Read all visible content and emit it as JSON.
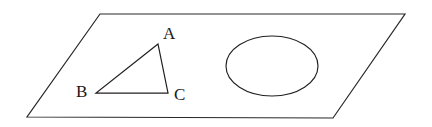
{
  "figure": {
    "caption": "",
    "background_color": "#ffffff",
    "stroke_color": "#231f20",
    "plane": {
      "name": "parallelogram-plane",
      "points": "100,14 405,14 333,118 27,117"
    },
    "triangle": {
      "name": "triangle-ABC",
      "points": "158,44 96,93 168,93",
      "vertices": [
        {
          "label": "A",
          "x": 158,
          "y": 44,
          "label_x": 163,
          "label_y": 39
        },
        {
          "label": "B",
          "x": 96,
          "y": 93,
          "label_x": 76,
          "label_y": 97
        },
        {
          "label": "C",
          "x": 168,
          "y": 93,
          "label_x": 174,
          "label_y": 100
        }
      ]
    },
    "ellipse": {
      "name": "ellipse-shape",
      "cx": 272,
      "cy": 66,
      "rx": 46,
      "ry": 30
    }
  }
}
